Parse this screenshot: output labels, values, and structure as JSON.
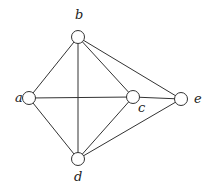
{
  "graph": {
    "node_radius": 6.5,
    "nodes": [
      {
        "id": "a",
        "label": "a",
        "x": 29,
        "y": 98,
        "lx": 15,
        "ly": 102
      },
      {
        "id": "b",
        "label": "b",
        "x": 78,
        "y": 37,
        "lx": 75,
        "ly": 19
      },
      {
        "id": "c",
        "label": "c",
        "x": 133,
        "y": 97,
        "lx": 138,
        "ly": 112
      },
      {
        "id": "d",
        "label": "d",
        "x": 78,
        "y": 159,
        "lx": 74,
        "ly": 181
      },
      {
        "id": "e",
        "label": "e",
        "x": 181,
        "y": 99,
        "lx": 194,
        "ly": 103
      }
    ],
    "edges": [
      [
        "a",
        "b"
      ],
      [
        "a",
        "c"
      ],
      [
        "a",
        "d"
      ],
      [
        "b",
        "c"
      ],
      [
        "b",
        "d"
      ],
      [
        "b",
        "e"
      ],
      [
        "c",
        "d"
      ],
      [
        "c",
        "e"
      ],
      [
        "d",
        "e"
      ]
    ],
    "colors": {
      "stroke": "#333333",
      "fill": "#ffffff",
      "label": "#222222"
    }
  }
}
